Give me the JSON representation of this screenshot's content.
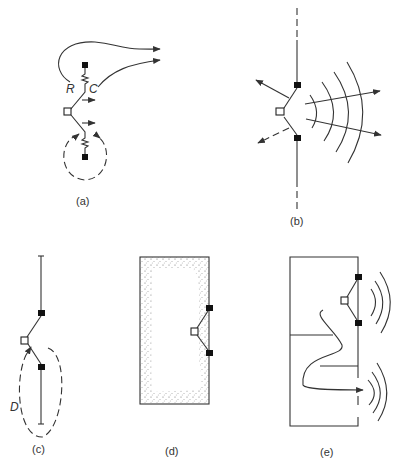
{
  "figure": {
    "panels": [
      {
        "id": "a",
        "label": "(a)",
        "annotations": [
          "R",
          "C"
        ]
      },
      {
        "id": "b",
        "label": "(b)",
        "annotations": []
      },
      {
        "id": "c",
        "label": "(c)",
        "annotations": [
          "D"
        ]
      },
      {
        "id": "d",
        "label": "(d)",
        "annotations": []
      },
      {
        "id": "e",
        "label": "(e)",
        "annotations": []
      }
    ]
  },
  "labels": {
    "a": "(a)",
    "b": "(b)",
    "c": "(c)",
    "d": "(d)",
    "e": "(e)",
    "R": "R",
    "C": "C",
    "D": "D"
  },
  "colors": {
    "stroke": "#333333",
    "terminal_fill": "#111111",
    "background": "#ffffff"
  }
}
